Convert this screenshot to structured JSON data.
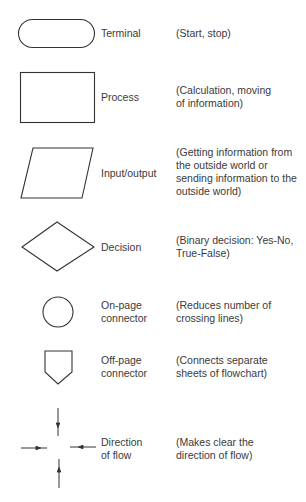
{
  "legend": {
    "title": "Flowchart symbols",
    "rows": [
      {
        "symbol": "terminal",
        "label": [
          "Terminal"
        ],
        "description": [
          "(Start, stop)"
        ]
      },
      {
        "symbol": "process",
        "label": [
          "Process"
        ],
        "description": [
          "(Calculation, moving",
          "of information)"
        ]
      },
      {
        "symbol": "input-output",
        "label": [
          "Input/output"
        ],
        "description": [
          "(Getting information from",
          "the outside world or",
          "sending information to the",
          "outside world)"
        ]
      },
      {
        "symbol": "decision",
        "label": [
          "Decision"
        ],
        "description": [
          "(Binary decision: Yes-No,",
          "True-False)"
        ]
      },
      {
        "symbol": "on-page-connector",
        "label": [
          "On-page",
          "connector"
        ],
        "description": [
          "(Reduces number of",
          "crossing lines)"
        ]
      },
      {
        "symbol": "off-page-connector",
        "label": [
          "Off-page",
          "connector"
        ],
        "description": [
          "(Connects separate",
          "sheets of flowchart)"
        ]
      },
      {
        "symbol": "direction-of-flow",
        "label": [
          "Direction",
          "of flow"
        ],
        "description": [
          "(Makes clear the",
          "direction of flow)"
        ]
      }
    ]
  },
  "colors": {
    "stroke": "#333333",
    "text": "#3a3a3a",
    "background": "#ffffff"
  }
}
